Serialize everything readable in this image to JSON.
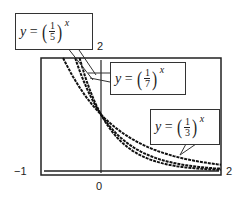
{
  "chart_data": {
    "type": "line",
    "title": "",
    "xlabel": "",
    "ylabel": "",
    "xlim": [
      -1,
      2
    ],
    "ylim": [
      0,
      2
    ],
    "grid": false,
    "tick_labels": {
      "x_min": "−1",
      "x_max": "2",
      "x_origin": "0",
      "y_max": "2"
    },
    "series": [
      {
        "name": "y = (1/5)^x",
        "base_num": "1",
        "base_den": "5",
        "exponent": "x",
        "base": 0.2,
        "x": [
          -0.43,
          0,
          0.5,
          1,
          1.5,
          2
        ],
        "y": [
          2.0,
          1.0,
          0.447,
          0.2,
          0.089,
          0.04
        ]
      },
      {
        "name": "y = (1/7)^x",
        "base_num": "1",
        "base_den": "7",
        "exponent": "x",
        "base": 0.142857,
        "x": [
          -0.36,
          0,
          0.5,
          1,
          1.5,
          2
        ],
        "y": [
          2.0,
          1.0,
          0.378,
          0.143,
          0.054,
          0.02
        ]
      },
      {
        "name": "y = (1/3)^x",
        "base_num": "1",
        "base_den": "3",
        "exponent": "x",
        "base": 0.333333,
        "x": [
          -0.63,
          0,
          0.5,
          1,
          1.5,
          2
        ],
        "y": [
          2.0,
          1.0,
          0.577,
          0.333,
          0.192,
          0.111
        ]
      }
    ],
    "annotations": [
      {
        "text": "y = (1/5)^x",
        "points_to": "steep curve near top-left"
      },
      {
        "text": "y = (1/7)^x",
        "points_to": "steepest curve near top"
      },
      {
        "text": "y = (1/3)^x",
        "points_to": "least steep curve at lower right"
      }
    ]
  },
  "labels": {
    "y_var": "y",
    "equals": "=",
    "exp": "x",
    "box1": {
      "num": "1",
      "den": "5"
    },
    "box2": {
      "num": "1",
      "den": "7"
    },
    "box3": {
      "num": "1",
      "den": "3"
    }
  }
}
